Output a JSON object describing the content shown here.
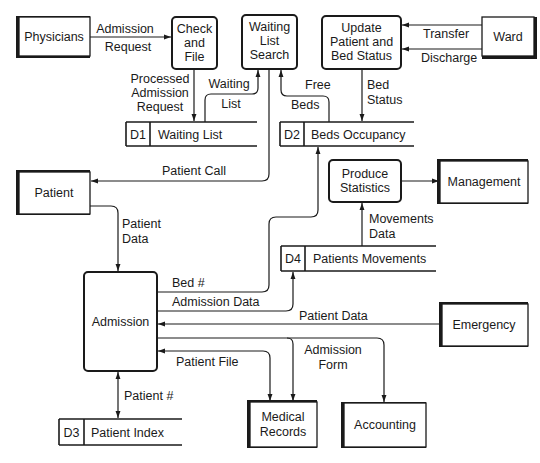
{
  "diagram": {
    "type": "data-flow-diagram",
    "external_entities": {
      "physicians": "Physicians",
      "ward": "Ward",
      "patient": "Patient",
      "management": "Management",
      "emergency": "Emergency",
      "medical_records": [
        "Medical",
        "Records"
      ],
      "accounting": "Accounting"
    },
    "processes": {
      "check_and_file": [
        "Check",
        "and",
        "File"
      ],
      "waiting_list_search": [
        "Waiting",
        "List",
        "Search"
      ],
      "update_status": [
        "Update",
        "Patient and",
        "Bed Status"
      ],
      "produce_statistics": [
        "Produce",
        "Statistics"
      ],
      "admission": "Admission"
    },
    "data_stores": {
      "d1": {
        "id": "D1",
        "name": "Waiting List"
      },
      "d2": {
        "id": "D2",
        "name": "Beds Occupancy"
      },
      "d3": {
        "id": "D3",
        "name": "Patient Index"
      },
      "d4": {
        "id": "D4",
        "name": "Patients Movements"
      }
    },
    "flows": {
      "admission_request": [
        "Admission",
        "Request"
      ],
      "processed_admission_request": [
        "Processed",
        "Admission",
        "Request"
      ],
      "waiting_list": [
        "Waiting",
        "List"
      ],
      "free_beds": [
        "Free",
        "Beds"
      ],
      "bed_status": [
        "Bed",
        "Status"
      ],
      "transfer": "Transfer",
      "discharge": "Discharge",
      "patient_call": "Patient Call",
      "patient_data_1": [
        "Patient",
        "Data"
      ],
      "movements_data": [
        "Movements",
        "Data"
      ],
      "bed_number": "Bed #",
      "admission_data": "Admission Data",
      "patient_data_2": "Patient Data",
      "admission_form": [
        "Admission",
        "Form"
      ],
      "patient_file": "Patient File",
      "patient_number": "Patient #"
    }
  }
}
